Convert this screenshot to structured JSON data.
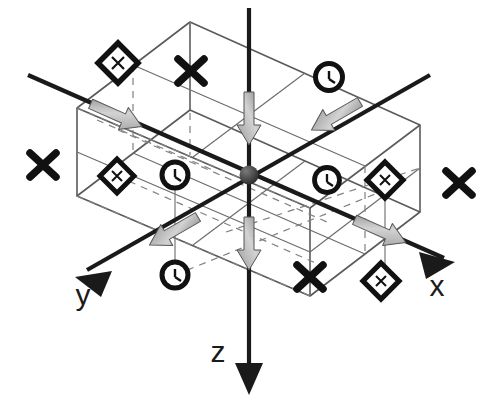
{
  "figure": {
    "background_color": "#ffffff",
    "ink_color": "#1a1a1a",
    "wire_color": "#555555",
    "dashed_color": "#777777",
    "arrow_gray_light": "#cfcfcf",
    "arrow_gray_dark": "#6e6e6e",
    "origin_color": "#3a3a3a"
  },
  "axes": [
    {
      "name": "x",
      "label": "x",
      "label_x": 437,
      "label_y": 296,
      "from": [
        28,
        75
      ],
      "to": [
        455,
        262
      ],
      "arrow_at": "to",
      "arrow_style": "solid-black",
      "direction": "down-right"
    },
    {
      "name": "y",
      "label": "y",
      "label_x": 83,
      "label_y": 305,
      "from": [
        430,
        75
      ],
      "to": [
        75,
        277
      ],
      "arrow_at": "to",
      "arrow_style": "solid-black",
      "direction": "down-left"
    },
    {
      "name": "z",
      "label": "z",
      "label_x": 218,
      "label_y": 362,
      "from": [
        249,
        8
      ],
      "to": [
        249,
        393
      ],
      "arrow_at": "to",
      "arrow_style": "solid-black",
      "direction": "down"
    }
  ],
  "origin": {
    "label": "origin",
    "x": 249,
    "y": 175,
    "radius": 9
  },
  "gray_arrows": [
    {
      "name": "gray-arrow-x-negative",
      "x": 118,
      "y": 116,
      "angle": 24,
      "axis": "x"
    },
    {
      "name": "gray-arrow-x-positive",
      "x": 382,
      "y": 232,
      "angle": 24,
      "axis": "x"
    },
    {
      "name": "gray-arrow-y-negative",
      "x": 334,
      "y": 117,
      "angle": 150,
      "axis": "y"
    },
    {
      "name": "gray-arrow-y-positive",
      "x": 172,
      "y": 232,
      "angle": 150,
      "axis": "y"
    },
    {
      "name": "gray-arrow-z-upper",
      "x": 249,
      "y": 120,
      "angle": 90,
      "axis": "z"
    },
    {
      "name": "gray-arrow-z-lower",
      "x": 249,
      "y": 245,
      "angle": 90,
      "axis": "z"
    }
  ],
  "markers": [
    {
      "name": "marker-diamond-top-left",
      "type": "diamond",
      "x": 118,
      "y": 63
    },
    {
      "name": "marker-cross-top-mid",
      "type": "cross",
      "x": 191,
      "y": 71
    },
    {
      "name": "marker-circle-top-right",
      "type": "circle",
      "x": 329,
      "y": 77
    },
    {
      "name": "marker-cross-left-edge",
      "type": "cross",
      "x": 43,
      "y": 165
    },
    {
      "name": "marker-diamond-mid-left",
      "type": "diamond",
      "x": 117,
      "y": 176
    },
    {
      "name": "marker-circle-mid-left",
      "type": "circle",
      "x": 175,
      "y": 175
    },
    {
      "name": "marker-circle-mid-right",
      "type": "circle",
      "x": 327,
      "y": 180
    },
    {
      "name": "marker-diamond-mid-right",
      "type": "diamond",
      "x": 385,
      "y": 180
    },
    {
      "name": "marker-cross-right-edge",
      "type": "cross",
      "x": 459,
      "y": 183
    },
    {
      "name": "marker-circle-bottom-left",
      "type": "circle",
      "x": 175,
      "y": 275
    },
    {
      "name": "marker-cross-bottom-mid",
      "type": "cross",
      "x": 310,
      "y": 277
    },
    {
      "name": "marker-diamond-bottom-right",
      "type": "diamond",
      "x": 381,
      "y": 281
    }
  ],
  "marker_legend": {
    "diamond": "diamond-with-inner-cross",
    "circle": "circle-with-inner-tick",
    "cross": "bold-x-cross"
  },
  "box": {
    "label": "rectangular-wireframe-cell",
    "top_face": [
      [
        190,
        22
      ],
      [
        420,
        125
      ],
      [
        310,
        208
      ],
      [
        77,
        108
      ]
    ],
    "bottom_face": [
      [
        190,
        110
      ],
      [
        420,
        212
      ],
      [
        310,
        296
      ],
      [
        77,
        196
      ]
    ],
    "height_px": 88,
    "grid_divisions_u": 2,
    "grid_divisions_v": 2
  }
}
